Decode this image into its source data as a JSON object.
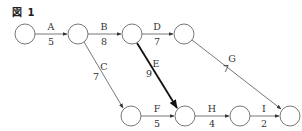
{
  "figure": {
    "title": "図 1"
  },
  "nodes": [
    {
      "id": "n1",
      "cx": 25,
      "cy": 34
    },
    {
      "id": "n2",
      "cx": 78,
      "cy": 34
    },
    {
      "id": "n3",
      "cx": 132,
      "cy": 34
    },
    {
      "id": "n4",
      "cx": 184,
      "cy": 34
    },
    {
      "id": "n5",
      "cx": 131,
      "cy": 116
    },
    {
      "id": "n6",
      "cx": 185,
      "cy": 116
    },
    {
      "id": "n7",
      "cx": 240,
      "cy": 116
    },
    {
      "id": "n8",
      "cx": 290,
      "cy": 116
    }
  ],
  "edges": [
    {
      "name": "A",
      "duration": "5",
      "from": "n1",
      "to": "n2",
      "bold": false
    },
    {
      "name": "B",
      "duration": "8",
      "from": "n2",
      "to": "n3",
      "bold": false
    },
    {
      "name": "C",
      "duration": "7",
      "from": "n2",
      "to": "n5",
      "bold": false
    },
    {
      "name": "D",
      "duration": "7",
      "from": "n3",
      "to": "n4",
      "bold": false
    },
    {
      "name": "E",
      "duration": "9",
      "from": "n3",
      "to": "n6",
      "bold": true
    },
    {
      "name": "F",
      "duration": "5",
      "from": "n5",
      "to": "n6",
      "bold": false
    },
    {
      "name": "G",
      "duration": "7",
      "from": "n4",
      "to": "n8",
      "bold": false
    },
    {
      "name": "H",
      "duration": "4",
      "from": "n6",
      "to": "n7",
      "bold": false
    },
    {
      "name": "I",
      "duration": "2",
      "from": "n7",
      "to": "n8",
      "bold": false
    }
  ],
  "colors": {
    "line": "#555555",
    "bold_line": "#111111",
    "node_stroke": "#555555"
  }
}
